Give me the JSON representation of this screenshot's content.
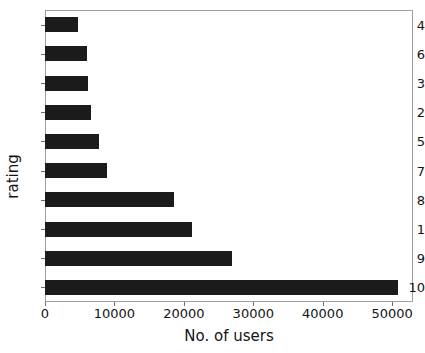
{
  "chart_data": {
    "type": "bar",
    "orientation": "horizontal",
    "title": "",
    "xlabel": "No. of users",
    "ylabel": "rating",
    "categories": [
      "4",
      "6",
      "3",
      "2",
      "5",
      "7",
      "8",
      "1",
      "9",
      "10"
    ],
    "values": [
      4700,
      6000,
      6200,
      6600,
      7800,
      9000,
      18600,
      21200,
      27000,
      50800
    ],
    "xlim": [
      0,
      53000
    ],
    "xticks": [
      0,
      10000,
      20000,
      30000,
      40000,
      50000
    ],
    "xtick_labels": [
      "0",
      "10000",
      "20000",
      "30000",
      "40000",
      "50000"
    ],
    "grid": false,
    "legend": null,
    "bar_color": "#1b1b1b",
    "background_color": "#ffffff",
    "axis_color": "#9e9e9e"
  }
}
